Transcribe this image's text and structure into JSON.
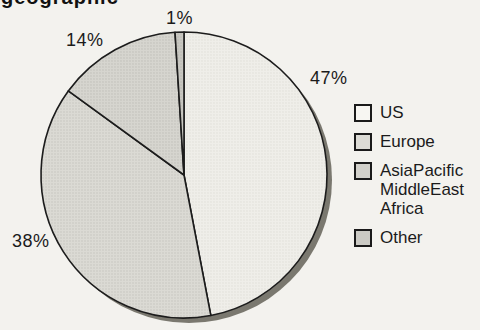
{
  "title_partial": "geographic",
  "chart_data": {
    "type": "pie",
    "title": "",
    "start_angle": "top",
    "direction": "clockwise",
    "legend_position": "right",
    "line_color": "#1c1c1c",
    "shadow_color": "#7a786f",
    "background_color": "#f3f2ee",
    "slices": [
      {
        "name": "US",
        "legend_label": "US",
        "value": 47,
        "pct_label": "47%",
        "fill": "#efeee9",
        "dot": "#deddd6",
        "legend_color": "#f7f6f2"
      },
      {
        "name": "Europe",
        "legend_label": "Europe",
        "value": 38,
        "pct_label": "38%",
        "fill": "#dbdad4",
        "dot": "#c2c1bb",
        "legend_color": "#dcdbd5"
      },
      {
        "name": "AsiaPacific MiddleEast Africa",
        "legend_label": "AsiaPacific\nMiddleEast\nAfrica",
        "value": 14,
        "pct_label": "14%",
        "fill": "#d6d5cf",
        "dot": "#bcbbb5",
        "legend_color": "#d2d1cb"
      },
      {
        "name": "Other",
        "legend_label": "Other",
        "value": 1,
        "pct_label": "1%",
        "fill": "#c8c7c1",
        "dot": "#b5b4ae",
        "legend_color": "#cbcac4"
      }
    ]
  }
}
